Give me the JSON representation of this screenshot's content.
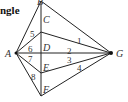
{
  "heading": "ngle",
  "points": {
    "A": {
      "label": "A",
      "x": 16,
      "y": 53
    },
    "B": {
      "label": "B",
      "x": 41,
      "y": 1
    },
    "C": {
      "label": "C",
      "x": 41,
      "y": 32
    },
    "D": {
      "label": "D",
      "x": 41,
      "y": 53
    },
    "E": {
      "label": "E",
      "x": 41,
      "y": 73
    },
    "F": {
      "label": "F",
      "x": 41,
      "y": 96
    },
    "G": {
      "label": "G",
      "x": 111,
      "y": 53
    }
  },
  "angle_labels": [
    "1",
    "2",
    "3",
    "4",
    "5",
    "6",
    "7",
    "8"
  ]
}
